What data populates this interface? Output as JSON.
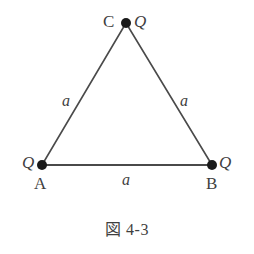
{
  "figure": {
    "caption": "図 4-3",
    "background_color": "#ffffff",
    "stroke_color": "#4a4a4a",
    "vertex_dot_color": "#1a1a1a",
    "vertices": [
      {
        "id": "C",
        "name_label": "C",
        "charge_label": "Q",
        "x": 126,
        "y": 23
      },
      {
        "id": "A",
        "name_label": "A",
        "charge_label": "Q",
        "x": 42,
        "y": 165
      },
      {
        "id": "B",
        "name_label": "B",
        "charge_label": "Q",
        "x": 212,
        "y": 165
      }
    ],
    "sides": [
      {
        "id": "CA",
        "length_label": "a",
        "from": "C",
        "to": "A"
      },
      {
        "id": "CB",
        "length_label": "a",
        "from": "C",
        "to": "B"
      },
      {
        "id": "AB",
        "length_label": "a",
        "from": "A",
        "to": "B"
      }
    ]
  }
}
